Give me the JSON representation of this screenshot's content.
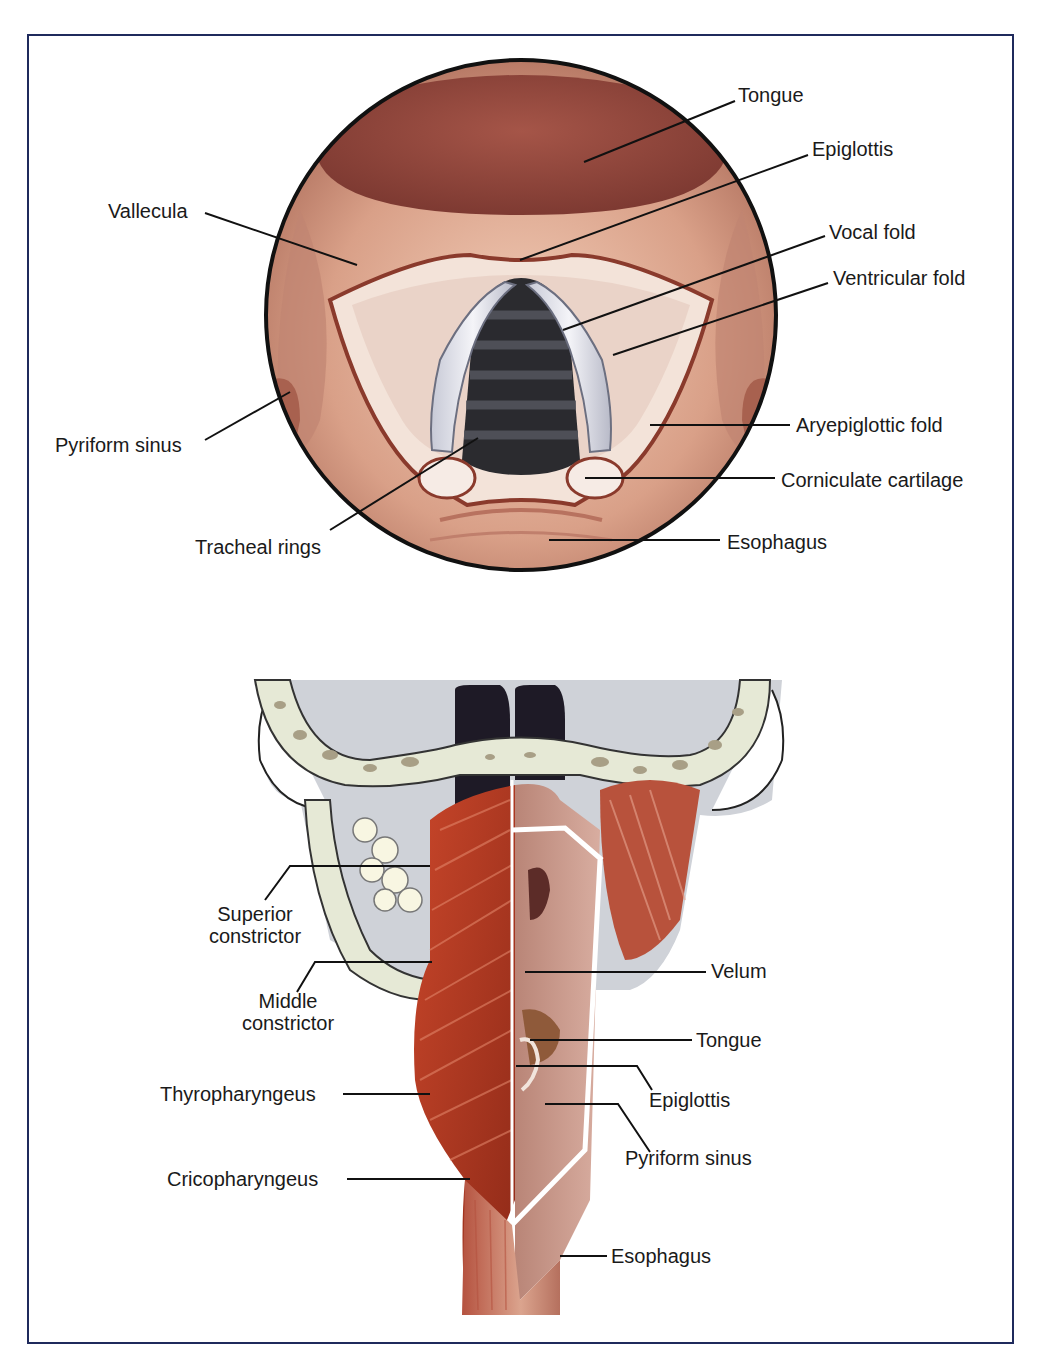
{
  "figure": {
    "panels": [
      {
        "id": "laryngoscopic-view",
        "description": "Superior (laryngoscopic) view of the larynx",
        "labels": {
          "tongue": "Tongue",
          "epiglottis": "Epiglottis",
          "vallecula": "Vallecula",
          "vocal_fold": "Vocal fold",
          "ventricular_fold": "Ventricular fold",
          "pyriform_sinus": "Pyriform sinus",
          "aryepiglottic_fold": "Aryepiglottic fold",
          "corniculate_cartilage": "Corniculate cartilage",
          "tracheal_rings": "Tracheal rings",
          "esophagus": "Esophagus"
        }
      },
      {
        "id": "posterior-pharynx-view",
        "description": "Posterior view of pharyngeal constrictor muscles with opened pharynx",
        "labels": {
          "superior_constrictor_1": "Superior",
          "superior_constrictor_2": "constrictor",
          "middle_constrictor_1": "Middle",
          "middle_constrictor_2": "constrictor",
          "thyropharyngeus": "Thyropharyngeus",
          "cricopharyngeus": "Cricopharyngeus",
          "velum": "Velum",
          "tongue": "Tongue",
          "epiglottis": "Epiglottis",
          "pyriform_sinus": "Pyriform sinus",
          "esophagus": "Esophagus"
        }
      }
    ],
    "colors": {
      "frame": "#1f2a5c",
      "tissue": "#d9a088",
      "tongue": "#9c4a3e",
      "muscle": "#b83a22",
      "bone": "#e8ead8",
      "airway": "#1c1c1c",
      "fold": "#f4e8e0"
    }
  }
}
